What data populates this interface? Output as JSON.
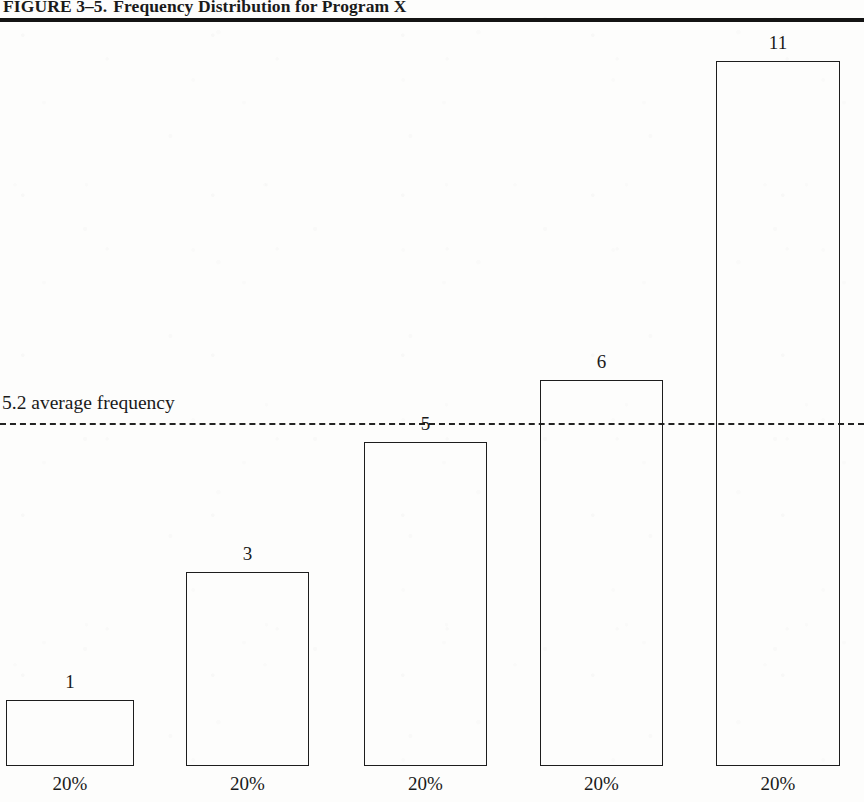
{
  "figure": {
    "label": "FIGURE 3–5.",
    "caption": "Frequency Distribution for Program X",
    "full_title": "FIGURE 3–5.  Frequency Distribution for Program X"
  },
  "annotation": {
    "average_text": "5.2 average frequency",
    "average_value": 5.2,
    "line_style": "dashed"
  },
  "colors": {
    "ink": "#1a1a1a",
    "rule": "#141414",
    "bar_stroke": "#1d1d1d",
    "bar_fill": "transparent",
    "page": "#fdfdfc"
  },
  "chart_data": {
    "type": "bar",
    "title": "Frequency Distribution for Program X",
    "xlabel": "",
    "ylabel": "",
    "categories": [
      "20%",
      "20%",
      "20%",
      "20%",
      "20%"
    ],
    "values": [
      1,
      3,
      5,
      6,
      11
    ],
    "value_labels": [
      "1",
      "3",
      "5",
      "6",
      "11"
    ],
    "tick_labels": [
      "20%",
      "20%",
      "20%",
      "20%",
      "20%"
    ],
    "ylim": [
      0,
      12
    ],
    "grid": false,
    "legend": null,
    "annotations": [
      {
        "text": "5.2 average frequency",
        "value": 5.2,
        "style": "dashed-horizontal-line"
      }
    ]
  },
  "bars": [
    {
      "value": "1",
      "pct": "20%",
      "left": 6,
      "width": 128,
      "top": 700,
      "height": 66,
      "label_top": 672,
      "label_left": 6,
      "label_width": 128,
      "pct_left": 6,
      "pct_width": 128
    },
    {
      "value": "3",
      "pct": "20%",
      "left": 186,
      "width": 123,
      "top": 572,
      "height": 194,
      "label_top": 544,
      "label_left": 186,
      "label_width": 123,
      "pct_left": 186,
      "pct_width": 123
    },
    {
      "value": "5",
      "pct": "20%",
      "left": 364,
      "width": 123,
      "top": 442,
      "height": 324,
      "label_top": 414,
      "label_left": 364,
      "label_width": 123,
      "pct_left": 364,
      "pct_width": 123
    },
    {
      "value": "6",
      "pct": "20%",
      "left": 540,
      "width": 123,
      "top": 380,
      "height": 386,
      "label_top": 352,
      "label_left": 540,
      "label_width": 123,
      "pct_left": 540,
      "pct_width": 123
    },
    {
      "value": "11",
      "pct": "20%",
      "left": 716,
      "width": 124,
      "top": 61,
      "height": 705,
      "label_top": 33,
      "label_left": 716,
      "label_width": 124,
      "pct_left": 716,
      "pct_width": 124
    }
  ],
  "geometry": {
    "avg_line_top": 423,
    "avg_label_top": 392,
    "baseline_top": 766,
    "pct_row_top": 773
  }
}
